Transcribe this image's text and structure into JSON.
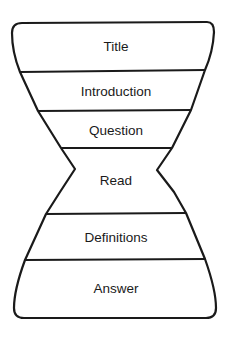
{
  "diagram": {
    "type": "hourglass",
    "stroke_color": "#1a1a1a",
    "background": "#ffffff",
    "sections": [
      {
        "label": "Title"
      },
      {
        "label": "Introduction"
      },
      {
        "label": "Question"
      },
      {
        "label": "Read"
      },
      {
        "label": "Definitions"
      },
      {
        "label": "Answer"
      }
    ]
  }
}
